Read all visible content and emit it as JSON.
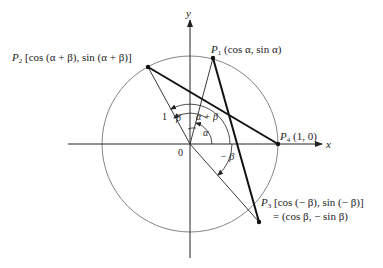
{
  "diagram": {
    "type": "unit-circle-angle-difference",
    "colors": {
      "ink": "#222222",
      "circle": "#777777",
      "background": "#ffffff"
    },
    "axes": {
      "x_label": "x",
      "y_label": "y",
      "origin_label": "0"
    },
    "radius_label": "1",
    "points": {
      "P1": {
        "name": "P",
        "sub": "1",
        "coords": "(cos α, sin α)"
      },
      "P2": {
        "name": "P",
        "sub": "2",
        "coords": "[cos (α + β), sin (α + β)]"
      },
      "P3": {
        "name": "P",
        "sub": "3",
        "coords": "[cos (− β), sin (− β)]",
        "coords_line2": "= (cos β, − sin β)"
      },
      "P4": {
        "name": "P",
        "sub": "4",
        "coords": "(1, 0)"
      }
    },
    "angle_labels": {
      "alpha": "α",
      "alpha_plus_beta": "α + β",
      "beta": "β",
      "minus_beta": "− β"
    }
  }
}
